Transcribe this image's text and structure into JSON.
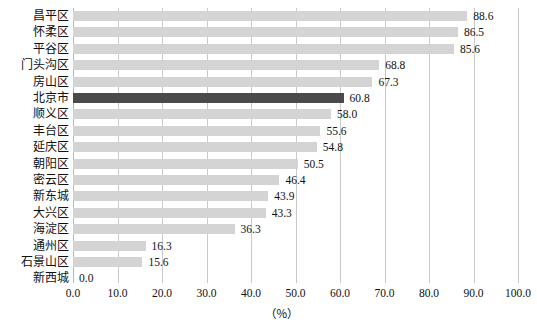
{
  "chart_data": {
    "type": "bar",
    "orientation": "horizontal",
    "title": "",
    "xlabel": "（％）",
    "ylabel": "",
    "xlim": [
      0.0,
      100.0
    ],
    "xticks": [
      "0.0",
      "10.0",
      "20.0",
      "30.0",
      "40.0",
      "50.0",
      "60.0",
      "70.0",
      "80.0",
      "90.0",
      "100.0"
    ],
    "xtick_values": [
      0,
      10,
      20,
      30,
      40,
      50,
      60,
      70,
      80,
      90,
      100
    ],
    "grid": "vertical",
    "legend": "none",
    "categories": [
      "昌平区",
      "怀柔区",
      "平谷区",
      "门头沟区",
      "房山区",
      "北京市",
      "顺义区",
      "丰台区",
      "延庆区",
      "朝阳区",
      "密云区",
      "新东城",
      "大兴区",
      "海淀区",
      "通州区",
      "石景山区",
      "新西城"
    ],
    "values": [
      88.6,
      86.5,
      85.6,
      68.8,
      67.3,
      60.8,
      58.0,
      55.6,
      54.8,
      50.5,
      46.4,
      43.9,
      43.3,
      36.3,
      16.3,
      15.6,
      0.0
    ],
    "value_labels": [
      "88.6",
      "86.5",
      "85.6",
      "68.8",
      "67.3",
      "60.8",
      "58.0",
      "55.6",
      "54.8",
      "50.5",
      "46.4",
      "43.9",
      "43.3",
      "36.3",
      "16.3",
      "15.6",
      "0.0"
    ],
    "highlight_category": "北京市",
    "colors": {
      "bar": "#d4d4d4",
      "bar_highlight": "#4a4a4a",
      "gridline": "#c9c9c9",
      "text": "#101010",
      "background": "#ffffff"
    }
  }
}
